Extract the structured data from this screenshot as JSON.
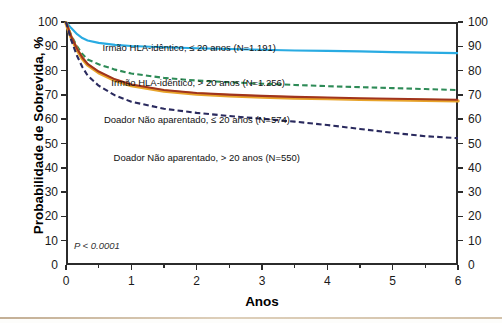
{
  "chart_data": {
    "type": "line",
    "title": "",
    "xlabel": "Anos",
    "ylabel": "Probabilidade de Sobrevida, %",
    "xlim": [
      0,
      6
    ],
    "ylim": [
      0,
      100
    ],
    "grid": false,
    "legend_position": "inline-right",
    "annotation": "P < 0.0001",
    "xticks": [
      "0",
      "1",
      "2",
      "3",
      "4",
      "5",
      "6"
    ],
    "yticks": [
      "0",
      "10",
      "20",
      "30",
      "40",
      "50",
      "60",
      "70",
      "80",
      "90",
      "100"
    ],
    "xtick_minor_step": 0.5,
    "series": [
      {
        "name": "Irmão HLA-idêntico, ≤ 20 anos (N=1.191)",
        "color": "#29ABE2",
        "style": "solid",
        "x": [
          0,
          0.08,
          0.17,
          0.25,
          0.33,
          0.5,
          0.75,
          1.0,
          1.5,
          2.0,
          2.5,
          3.0,
          3.5,
          4.0,
          4.5,
          5.0,
          5.5,
          6.0
        ],
        "y": [
          100,
          97.5,
          95.0,
          93.4,
          92.4,
          91.4,
          90.6,
          90.1,
          89.6,
          89.2,
          88.9,
          88.6,
          88.3,
          88.1,
          87.9,
          87.6,
          87.4,
          87.2
        ]
      },
      {
        "name": "Irmão HLA-idêntico, > 20 anos (N=1.256)",
        "color": "#2E8B57",
        "style": "dashed",
        "x": [
          0,
          0.08,
          0.17,
          0.25,
          0.33,
          0.5,
          0.75,
          1.0,
          1.5,
          2.0,
          2.5,
          3.0,
          3.5,
          4.0,
          4.5,
          5.0,
          5.5,
          6.0
        ],
        "y": [
          100,
          94.5,
          90.0,
          86.8,
          84.6,
          82.6,
          80.4,
          78.8,
          77.0,
          75.9,
          75.2,
          74.6,
          74.1,
          73.6,
          73.2,
          72.8,
          72.4,
          72.0
        ]
      },
      {
        "name": "Doador Não aparentado, ≤ 20 anos (N=574)",
        "color": "#A0341E",
        "style": "solid",
        "x": [
          0,
          0.08,
          0.17,
          0.25,
          0.33,
          0.5,
          0.75,
          1.0,
          1.5,
          2.0,
          2.5,
          3.0,
          3.5,
          4.0,
          4.5,
          5.0,
          5.5,
          6.0
        ],
        "y": [
          100,
          94.0,
          89.0,
          85.4,
          82.8,
          79.6,
          76.4,
          74.3,
          72.0,
          70.8,
          70.1,
          69.6,
          69.2,
          68.9,
          68.6,
          68.4,
          68.2,
          68.0
        ]
      },
      {
        "name": "Doador Não aparentado, > 20 anos (N=550)",
        "color": "#2A2A5E",
        "style": "dashed",
        "x": [
          0,
          0.08,
          0.17,
          0.25,
          0.33,
          0.5,
          0.75,
          1.0,
          1.5,
          2.0,
          2.5,
          3.0,
          3.5,
          4.0,
          4.5,
          5.0,
          5.5,
          6.0
        ],
        "y": [
          100,
          92.5,
          86.0,
          81.5,
          78.0,
          73.8,
          69.8,
          67.2,
          64.3,
          62.6,
          61.3,
          60.2,
          59.0,
          57.6,
          56.0,
          54.4,
          53.0,
          52.2
        ]
      }
    ]
  },
  "axes": {
    "y_title": "Probabilidade de Sobrevida, %",
    "x_title": "Anos"
  },
  "annotations": {
    "p_value": "P < 0.0001"
  },
  "legend": [
    {
      "label": "Irmão HLA-idêntico, ≤ 20 anos (N=1.191)",
      "x": 276,
      "y": 43
    },
    {
      "label": "Irmão HLA-idêntico, > 20 anos (N=1.256)",
      "x": 285,
      "y": 78
    },
    {
      "label": "Doador Não aparentado, ≤ 20 anos (N=574)",
      "x": 290,
      "y": 115
    },
    {
      "label": "Doador Não aparentado, > 20 anos (N=550)",
      "x": 300,
      "y": 153
    }
  ]
}
